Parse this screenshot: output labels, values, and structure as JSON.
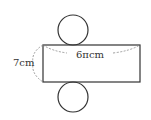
{
  "diagram": {
    "type": "cylinder-net",
    "labels": {
      "height": "7cm",
      "circumference": "6πcm"
    },
    "colors": {
      "stroke": "#333333",
      "dashed": "#777777",
      "text": "#333333"
    }
  }
}
